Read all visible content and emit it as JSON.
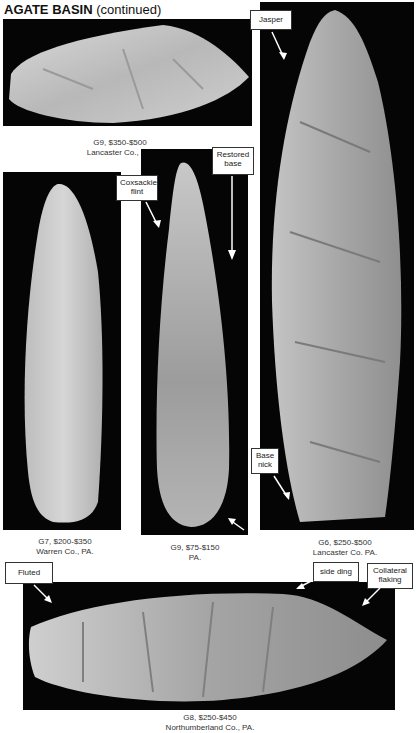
{
  "page": {
    "title_bold": "AGATE BASIN",
    "title_suffix": "(continued)"
  },
  "artifacts": [
    {
      "id": "top-left",
      "grade_price": "G9, $350-$500",
      "location": "Lancaster  Co., PA.",
      "labels": []
    },
    {
      "id": "right-tall",
      "grade_price": "G6, $250-$500",
      "location": "Lancaster Co. PA.",
      "labels": [
        "Jasper",
        "Base nick"
      ]
    },
    {
      "id": "left-mid",
      "grade_price": "G7, $200-$350",
      "location": "Warren Co., PA.",
      "labels": []
    },
    {
      "id": "center-mid",
      "grade_price": "G9, $75-$150",
      "location": "PA.",
      "labels": [
        "Coxsackie flint",
        "Restored base"
      ]
    },
    {
      "id": "bottom",
      "grade_price": "G8, $250-$450",
      "location": "Northumberland Co., PA.",
      "labels": [
        "Fluted",
        "side ding",
        "Collateral flaking"
      ]
    }
  ],
  "labels": {
    "jasper": "Jasper",
    "base_nick_1": "Base",
    "base_nick_2": "nick",
    "coxsackie_1": "Coxsackie",
    "coxsackie_2": "flint",
    "restored_1": "Restored",
    "restored_2": "base",
    "fluted": "Fluted",
    "side_ding": "side ding",
    "collateral_1": "Collateral",
    "collateral_2": "flaking"
  }
}
